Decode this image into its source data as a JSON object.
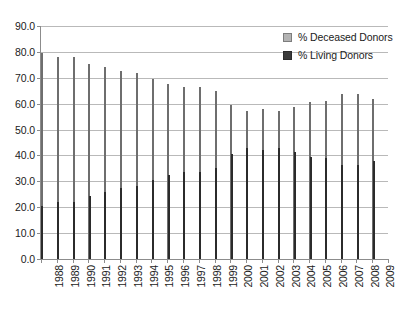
{
  "chart_data": {
    "type": "bar",
    "title": "",
    "subtitle": "",
    "xlabel": "",
    "ylabel": "",
    "ylim": [
      0.0,
      90.0
    ],
    "yticks": [
      "0.0",
      "10.0",
      "20.0",
      "30.0",
      "40.0",
      "50.0",
      "60.0",
      "70.0",
      "80.0",
      "90.0"
    ],
    "ytick_values": [
      0,
      10,
      20,
      30,
      40,
      50,
      60,
      70,
      80,
      90
    ],
    "grid": true,
    "legend_position": "top-right",
    "categories": [
      "1988",
      "1989",
      "1990",
      "1991",
      "1992",
      "1993",
      "1994",
      "1995",
      "1996",
      "1997",
      "1998",
      "1999",
      "2000",
      "2001",
      "2002",
      "2003",
      "2004",
      "2005",
      "2006",
      "2007",
      "2008",
      "2009"
    ],
    "series": [
      {
        "name": "% Deceased Donors",
        "color": "#8e8e8e",
        "values": [
          79.5,
          78.0,
          78.0,
          75.5,
          74.2,
          72.6,
          71.8,
          69.5,
          67.7,
          66.3,
          66.3,
          64.8,
          59.3,
          57.2,
          57.8,
          57.0,
          58.6,
          60.6,
          61.0,
          63.8,
          63.7,
          62.0
        ]
      },
      {
        "name": "% Living Donors",
        "color": "#3a3a3a",
        "values": [
          20.5,
          22.0,
          22.1,
          24.5,
          25.8,
          27.4,
          28.2,
          30.5,
          32.3,
          33.7,
          33.7,
          35.2,
          40.7,
          42.8,
          42.2,
          43.0,
          41.4,
          39.4,
          39.0,
          36.2,
          36.3,
          38.0
        ]
      }
    ]
  }
}
